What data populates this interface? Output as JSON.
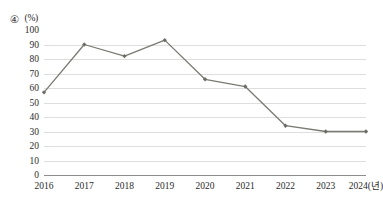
{
  "header": {
    "item_number": "④",
    "unit": "(%)"
  },
  "chart_data": {
    "type": "line",
    "title": "",
    "xlabel": "",
    "ylabel": "",
    "unit": "(%)",
    "categories": [
      "2016",
      "2017",
      "2018",
      "2019",
      "2020",
      "2021",
      "2022",
      "2023",
      "2024(년)"
    ],
    "values": [
      57,
      90,
      82,
      93,
      66,
      61,
      34,
      30,
      30
    ],
    "series": [
      {
        "name": "series-1",
        "values": [
          57,
          90,
          82,
          93,
          66,
          61,
          34,
          30,
          30
        ]
      }
    ],
    "ylim": [
      0,
      100
    ],
    "ytick_step": 10,
    "yticks": [
      "100",
      "90",
      "80",
      "70",
      "60",
      "50",
      "40",
      "30",
      "20",
      "10",
      "0"
    ],
    "grid": "horizontal",
    "legend": "none",
    "line_color": "#7a7a72",
    "marker_color": "#6e6e66",
    "gridline_color": "#dedede",
    "baseline_color": "#8d8d8d"
  }
}
